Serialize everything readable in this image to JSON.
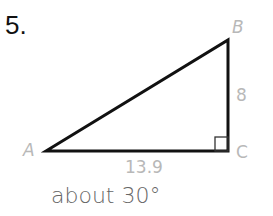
{
  "problem": {
    "number": "5.",
    "vertices": {
      "A": "A",
      "B": "B",
      "C": "C"
    },
    "side_BC": "8",
    "side_AC": "13.9",
    "answer": "about 30°",
    "right_angle_at": "C"
  }
}
